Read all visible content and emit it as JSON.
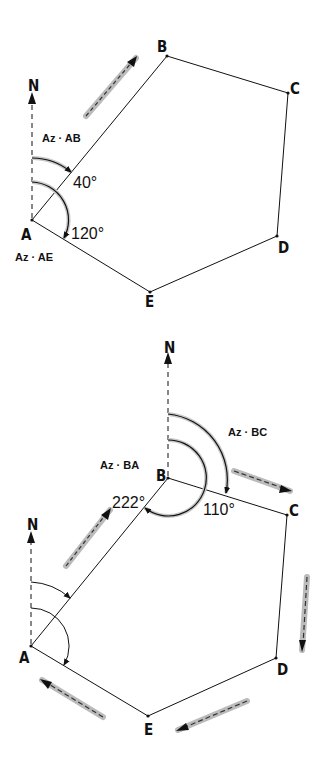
{
  "figure_top": {
    "vertices": {
      "A": "A",
      "B": "B",
      "C": "C",
      "D": "D",
      "E": "E"
    },
    "north_label": "N",
    "az_ab_label": "Az · AB",
    "az_ae_label": "Az · AE",
    "angle_ab": "40°",
    "angle_ae": "120°"
  },
  "figure_bottom": {
    "vertices": {
      "A": "A",
      "B": "B",
      "C": "C",
      "D": "D",
      "E": "E"
    },
    "north_label_b": "N",
    "north_label_a": "N",
    "az_ba_label": "Az · BA",
    "az_bc_label": "Az · BC",
    "angle_ba": "222°",
    "angle_bc": "110°"
  },
  "colors": {
    "line": "#111111",
    "shadow": "#b8b8b8"
  }
}
